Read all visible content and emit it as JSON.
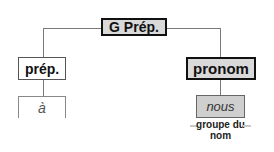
{
  "diagram": {
    "type": "syntax-tree",
    "root": {
      "label": "G Prép."
    },
    "children": [
      {
        "label": "prép.",
        "leaf": "à"
      },
      {
        "label": "pronom",
        "leaf": "nous",
        "annotation": "groupe du nom"
      }
    ]
  },
  "colors": {
    "highlight_fill": "#d9d9d9",
    "border_dark": "#111111",
    "connector": "#7a7a7a"
  }
}
